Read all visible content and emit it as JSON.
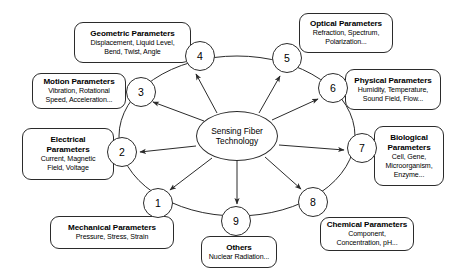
{
  "diagram": {
    "hub": {
      "label": "Sensing Fiber\nTechnology",
      "cx": 237,
      "cy": 136,
      "rx": 41,
      "ry": 25
    },
    "ring": {
      "cx": 237,
      "cy": 136,
      "rx": 118,
      "ry": 80
    },
    "colors": {
      "stroke": "#2b2b2b",
      "text": "#000000",
      "background": "#ffffff"
    },
    "nodes": [
      {
        "number": "1",
        "title": "Mechanical Parameters",
        "subtitle": "Pressure, Stress, Strain",
        "circle": {
          "cx": 158,
          "cy": 203,
          "r": 15
        },
        "box": {
          "x": 50,
          "y": 216,
          "w": 124,
          "h": 33
        }
      },
      {
        "number": "2",
        "title": "Electrical\nParameters",
        "subtitle": "Current, Magnetic\nField, Voltage",
        "circle": {
          "cx": 122,
          "cy": 152,
          "r": 15
        },
        "box": {
          "x": 22,
          "y": 128,
          "w": 92,
          "h": 52
        }
      },
      {
        "number": "3",
        "title": "Motion Parameters",
        "subtitle": "Vibration, Rotational\nSpeed, Acceleration...",
        "circle": {
          "cx": 141,
          "cy": 92,
          "r": 15
        },
        "box": {
          "x": 32,
          "y": 73,
          "w": 94,
          "h": 36
        }
      },
      {
        "number": "4",
        "title": "Geometric Parameters",
        "subtitle": "Displacement, Liquid Level,\nBend, Twist, Angle",
        "circle": {
          "cx": 200,
          "cy": 56,
          "r": 15
        },
        "box": {
          "x": 74,
          "y": 22,
          "w": 117,
          "h": 41
        }
      },
      {
        "number": "5",
        "title": "Optical Parameters",
        "subtitle": "Refraction, Spectrum,\nPolarization...",
        "circle": {
          "cx": 287,
          "cy": 58,
          "r": 15
        },
        "box": {
          "x": 299,
          "y": 13,
          "w": 94,
          "h": 40
        }
      },
      {
        "number": "6",
        "title": "Physical Parameters",
        "subtitle": "Humidity, Temperature,\nSound Field, Flow...",
        "circle": {
          "cx": 333,
          "cy": 88,
          "r": 15
        },
        "box": {
          "x": 345,
          "y": 69,
          "w": 96,
          "h": 41
        }
      },
      {
        "number": "7",
        "title": "Biological\nParameters",
        "subtitle": "Cell, Gene,\nMicroorganism,\nEnzyme...",
        "circle": {
          "cx": 362,
          "cy": 148,
          "r": 15
        },
        "box": {
          "x": 374,
          "y": 126,
          "w": 70,
          "h": 60
        }
      },
      {
        "number": "8",
        "title": "Chemical Parameters",
        "subtitle": "Component,\nConcentration, pH...",
        "circle": {
          "cx": 313,
          "cy": 202,
          "r": 15
        },
        "box": {
          "x": 320,
          "y": 217,
          "w": 94,
          "h": 34
        }
      },
      {
        "number": "9",
        "title": "Others",
        "subtitle": "Nuclear Radiation...",
        "circle": {
          "cx": 236,
          "cy": 221,
          "r": 15
        },
        "box": {
          "x": 201,
          "y": 236,
          "w": 76,
          "h": 32
        }
      }
    ],
    "arrows": [
      {
        "target": "1",
        "from": [
          212,
          158
        ],
        "to": [
          170,
          190
        ]
      },
      {
        "target": "2",
        "from": [
          196,
          146
        ],
        "to": [
          140,
          152
        ]
      },
      {
        "target": "3",
        "from": [
          204,
          121
        ],
        "to": [
          153,
          102
        ]
      },
      {
        "target": "4",
        "from": [
          217,
          113
        ],
        "to": [
          196,
          74
        ]
      },
      {
        "target": "5",
        "from": [
          259,
          113
        ],
        "to": [
          280,
          76
        ]
      },
      {
        "target": "6",
        "from": [
          272,
          120
        ],
        "to": [
          318,
          99
        ]
      },
      {
        "target": "7",
        "from": [
          279,
          145
        ],
        "to": [
          344,
          150
        ]
      },
      {
        "target": "8",
        "from": [
          265,
          157
        ],
        "to": [
          301,
          189
        ]
      },
      {
        "target": "9",
        "from": [
          237,
          161
        ],
        "to": [
          237,
          204
        ]
      }
    ]
  }
}
